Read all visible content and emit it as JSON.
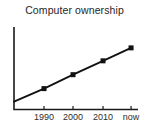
{
  "chart_data": {
    "type": "line",
    "title": "Computer ownership",
    "xlabel": "",
    "ylabel": "",
    "x_tick_labels": [
      "1990",
      "2000",
      "2010",
      "now"
    ],
    "y_tick_labels": [],
    "grid": false,
    "legend": false,
    "axis_color": "#1a1a1a",
    "line_color": "#111111",
    "marker": "filled-square",
    "marker_color": "#111111",
    "note": "No y-axis scale shown; values are relative fractions of plot height showing a steady linear rise in computer ownership from 1990 to now",
    "points": [
      {
        "label": "",
        "x_frac": 0.0,
        "y_frac": 0.096,
        "marker": false
      },
      {
        "label": "1990",
        "x_frac": 0.242,
        "y_frac": 0.253,
        "marker": true
      },
      {
        "label": "2000",
        "x_frac": 0.476,
        "y_frac": 0.422,
        "marker": true
      },
      {
        "label": "2010",
        "x_frac": 0.718,
        "y_frac": 0.59,
        "marker": true
      },
      {
        "label": "now",
        "x_frac": 0.944,
        "y_frac": 0.747,
        "marker": true
      }
    ]
  }
}
